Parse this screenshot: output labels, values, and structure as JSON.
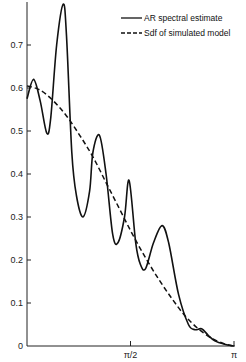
{
  "chart_data": {
    "type": "line",
    "title": "",
    "xlabel": "",
    "ylabel": "",
    "xlim": [
      0,
      3.14159
    ],
    "ylim": [
      0,
      0.8
    ],
    "grid": false,
    "legend_position": "upper right",
    "x_ticks": [
      {
        "value": 0,
        "label": ""
      },
      {
        "value": 1.5708,
        "label": "π/2"
      },
      {
        "value": 3.14159,
        "label": "π"
      }
    ],
    "y_ticks": [
      {
        "value": 0,
        "label": "0"
      },
      {
        "value": 0.1,
        "label": "0.1"
      },
      {
        "value": 0.2,
        "label": "0.2"
      },
      {
        "value": 0.3,
        "label": "0.3"
      },
      {
        "value": 0.4,
        "label": "0.4"
      },
      {
        "value": 0.5,
        "label": "0.5"
      },
      {
        "value": 0.6,
        "label": "0.6"
      },
      {
        "value": 0.7,
        "label": "0.7"
      }
    ],
    "series": [
      {
        "name": "AR spectral estimate",
        "style": "solid",
        "x": [
          0,
          0.1,
          0.2,
          0.3,
          0.36,
          0.45,
          0.55,
          0.6,
          0.68,
          0.75,
          0.85,
          0.95,
          1.0,
          1.1,
          1.2,
          1.3,
          1.38,
          1.48,
          1.55,
          1.65,
          1.72,
          1.8,
          1.92,
          2.05,
          2.15,
          2.3,
          2.45,
          2.55,
          2.65,
          2.75,
          2.85,
          3.0,
          3.14159
        ],
        "values": [
          0.575,
          0.62,
          0.57,
          0.495,
          0.53,
          0.7,
          0.795,
          0.72,
          0.45,
          0.35,
          0.3,
          0.36,
          0.45,
          0.49,
          0.4,
          0.26,
          0.24,
          0.3,
          0.385,
          0.24,
          0.19,
          0.18,
          0.24,
          0.28,
          0.24,
          0.12,
          0.05,
          0.038,
          0.04,
          0.025,
          0.012,
          0.004,
          0
        ]
      },
      {
        "name": "Sdf of simulated model",
        "style": "dashed",
        "x": [
          0,
          0.2,
          0.4,
          0.6,
          0.8,
          1.0,
          1.2,
          1.4,
          1.6,
          1.8,
          2.0,
          2.2,
          2.4,
          2.6,
          2.8,
          3.0,
          3.14159
        ],
        "values": [
          0.605,
          0.595,
          0.57,
          0.535,
          0.49,
          0.44,
          0.38,
          0.32,
          0.26,
          0.205,
          0.155,
          0.11,
          0.07,
          0.04,
          0.018,
          0.005,
          0
        ]
      }
    ]
  },
  "legend": {
    "items": [
      {
        "label": "AR spectral estimate",
        "style": "solid"
      },
      {
        "label": "Sdf of simulated model",
        "style": "dashed"
      }
    ]
  },
  "colors": {
    "line": "#111111",
    "axis": "#222222",
    "background": "#ffffff"
  }
}
